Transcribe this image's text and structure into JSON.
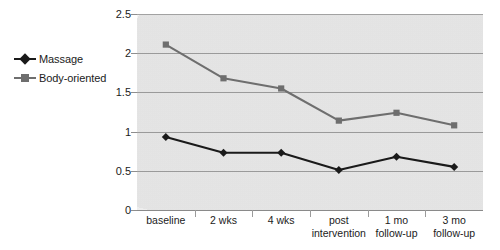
{
  "chart_data": {
    "type": "line",
    "title": "",
    "xlabel": "",
    "ylabel": "",
    "categories": [
      "baseline",
      "2 wks",
      "4 wks",
      "post intervention",
      "1 mo follow-up",
      "3 mo follow-up"
    ],
    "category_lines": [
      [
        "baseline"
      ],
      [
        "2 wks"
      ],
      [
        "4 wks"
      ],
      [
        "post",
        "intervention"
      ],
      [
        "1 mo",
        "follow-up"
      ],
      [
        "3 mo",
        "follow-up"
      ]
    ],
    "yticks": [
      "0",
      "0.5",
      "1",
      "1.5",
      "2",
      "2.5"
    ],
    "ytick_values": [
      0,
      0.5,
      1,
      1.5,
      2,
      2.5
    ],
    "ylim": [
      0,
      2.5
    ],
    "grid": true,
    "legend_position": "left-outside",
    "series": [
      {
        "name": "Massage",
        "color": "#1a1a1a",
        "marker": "diamond",
        "values": [
          0.93,
          0.73,
          0.73,
          0.51,
          0.68,
          0.55
        ]
      },
      {
        "name": "Body-oriented",
        "color": "#6e6e6e",
        "marker": "square",
        "values": [
          2.11,
          1.68,
          1.55,
          1.14,
          1.24,
          1.08
        ]
      }
    ]
  },
  "legend": {
    "items": [
      {
        "label": "Massage",
        "marker": "diamond-marker",
        "color": "#1a1a1a"
      },
      {
        "label": "Body-oriented",
        "marker": "square-marker",
        "color": "#6e6e6e"
      }
    ]
  },
  "colors": {
    "plot_background": "#e9e9e9",
    "gridline": "#9a9a9a",
    "page_background": "#ffffff",
    "text": "#1b1b1b",
    "massage_series": "#1a1a1a",
    "body_oriented_series": "#6e6e6e"
  }
}
